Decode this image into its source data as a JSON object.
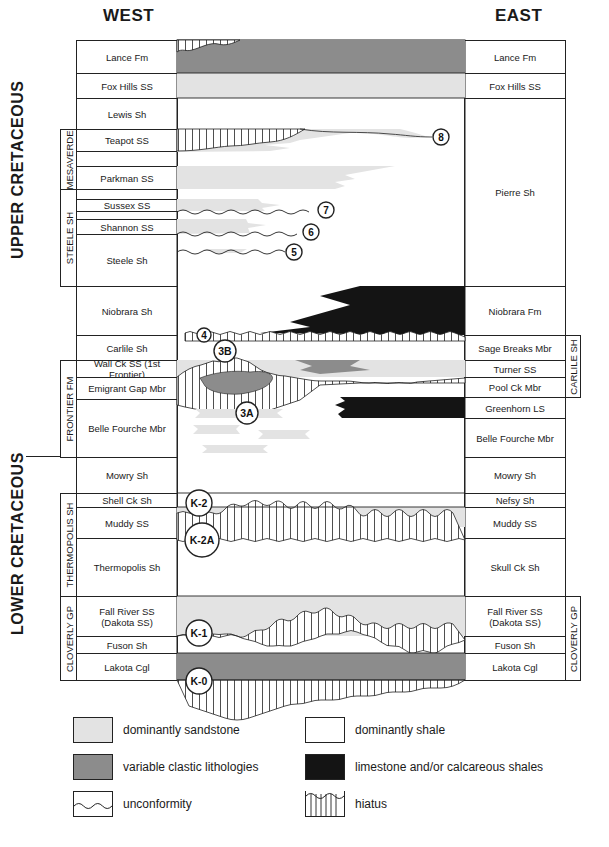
{
  "headers": {
    "west": "WEST",
    "east": "EAST"
  },
  "eras": {
    "upper": "UPPER CRETACEOUS",
    "lower": "LOWER CRETACEOUS"
  },
  "groups": {
    "west": [
      {
        "label": "MESAVERDE",
        "top": 129,
        "bottom": 189
      },
      {
        "label": "STEELE SH",
        "top": 189,
        "bottom": 286
      },
      {
        "label": "FRONTIER FM",
        "top": 360,
        "bottom": 457
      },
      {
        "label": "THERMOPOLIS SH",
        "top": 493,
        "bottom": 596
      },
      {
        "label": "CLOVERLY GP",
        "top": 596,
        "bottom": 680
      }
    ],
    "east": [
      {
        "label": "CARLILE SH",
        "top": 335,
        "bottom": 397
      },
      {
        "label": "CLOVERLY GP",
        "top": 596,
        "bottom": 680
      }
    ]
  },
  "west_units": [
    {
      "label": "Lance Fm",
      "top": 40,
      "bottom": 73
    },
    {
      "label": "Fox Hills SS",
      "top": 73,
      "bottom": 98
    },
    {
      "label": "Lewis Sh",
      "top": 98,
      "bottom": 129
    },
    {
      "label": "Teapot SS",
      "top": 129,
      "bottom": 151
    },
    {
      "label": "",
      "top": 151,
      "bottom": 166
    },
    {
      "label": "Parkman SS",
      "top": 166,
      "bottom": 189
    },
    {
      "label": "",
      "top": 189,
      "bottom": 199
    },
    {
      "label": "Sussex SS",
      "top": 199,
      "bottom": 211
    },
    {
      "label": "",
      "top": 211,
      "bottom": 219
    },
    {
      "label": "Shannon SS",
      "top": 219,
      "bottom": 234
    },
    {
      "label": "Steele Sh",
      "top": 234,
      "bottom": 286
    },
    {
      "label": "Niobrara Sh",
      "top": 286,
      "bottom": 335
    },
    {
      "label": "Carlile Sh",
      "top": 335,
      "bottom": 360
    },
    {
      "label": "Wall Ck SS (1st Frontier)",
      "top": 360,
      "bottom": 377
    },
    {
      "label": "Emigrant Gap Mbr",
      "top": 377,
      "bottom": 399
    },
    {
      "label": "Belle Fourche Mbr",
      "top": 399,
      "bottom": 457
    },
    {
      "label": "Mowry Sh",
      "top": 457,
      "bottom": 493
    },
    {
      "label": "Shell Ck Sh",
      "top": 493,
      "bottom": 507
    },
    {
      "label": "Muddy SS",
      "top": 507,
      "bottom": 538
    },
    {
      "label": "Thermopolis Sh",
      "top": 538,
      "bottom": 596
    },
    {
      "label": "Fall River SS\n(Dakota SS)",
      "top": 596,
      "bottom": 636
    },
    {
      "label": "Fuson Sh",
      "top": 636,
      "bottom": 653
    },
    {
      "label": "Lakota Cgl",
      "top": 653,
      "bottom": 680
    }
  ],
  "east_units": [
    {
      "label": "Lance Fm",
      "top": 40,
      "bottom": 73
    },
    {
      "label": "Fox Hills SS",
      "top": 73,
      "bottom": 98
    },
    {
      "label": "Pierre Sh",
      "top": 98,
      "bottom": 286
    },
    {
      "label": "Niobrara Fm",
      "top": 286,
      "bottom": 335
    },
    {
      "label": "Sage Breaks Mbr",
      "top": 335,
      "bottom": 360
    },
    {
      "label": "Turner SS",
      "top": 360,
      "bottom": 377
    },
    {
      "label": "Pool Ck Mbr",
      "top": 377,
      "bottom": 397
    },
    {
      "label": "Greenhorn LS",
      "top": 397,
      "bottom": 418
    },
    {
      "label": "Belle Fourche Mbr",
      "top": 418,
      "bottom": 457
    },
    {
      "label": "Mowry Sh",
      "top": 457,
      "bottom": 493
    },
    {
      "label": "Nefsy Sh",
      "top": 493,
      "bottom": 507
    },
    {
      "label": "Muddy SS",
      "top": 507,
      "bottom": 538
    },
    {
      "label": "Skull Ck Sh",
      "top": 538,
      "bottom": 596
    },
    {
      "label": "Fall River SS\n(Dakota SS)",
      "top": 596,
      "bottom": 636
    },
    {
      "label": "Fuson Sh",
      "top": 636,
      "bottom": 653
    },
    {
      "label": "Lakota Cgl",
      "top": 653,
      "bottom": 680
    }
  ],
  "markers": [
    {
      "label": "8",
      "x": 441,
      "y": 137,
      "r": 8
    },
    {
      "label": "7",
      "x": 326,
      "y": 210,
      "r": 8
    },
    {
      "label": "6",
      "x": 311,
      "y": 232,
      "r": 8
    },
    {
      "label": "5",
      "x": 294,
      "y": 252,
      "r": 8
    },
    {
      "label": "4",
      "x": 204,
      "y": 335,
      "r": 7
    },
    {
      "label": "3B",
      "x": 225,
      "y": 351,
      "r": 11
    },
    {
      "label": "3A",
      "x": 247,
      "y": 413,
      "r": 11
    },
    {
      "label": "K-2",
      "x": 199,
      "y": 503,
      "r": 13
    },
    {
      "label": "K-2A",
      "x": 202,
      "y": 540,
      "r": 17
    },
    {
      "label": "K-1",
      "x": 199,
      "y": 633,
      "r": 13
    },
    {
      "label": "K-0",
      "x": 199,
      "y": 681,
      "r": 13
    }
  ],
  "colors": {
    "sandstone": "#e3e3e3",
    "variable_clastic": "#8c8c8c",
    "shale": "#ffffff",
    "limestone": "#141414",
    "line": "#222222"
  },
  "legend": [
    {
      "key": "sandstone",
      "label": "dominantly sandstone"
    },
    {
      "key": "shale",
      "label": "dominantly shale"
    },
    {
      "key": "variable_clastic",
      "label": "variable clastic lithologies"
    },
    {
      "key": "limestone",
      "label": "limestone and/or calcareous shales"
    },
    {
      "key": "unconformity",
      "label": "unconformity"
    },
    {
      "key": "hiatus",
      "label": "hiatus"
    }
  ]
}
